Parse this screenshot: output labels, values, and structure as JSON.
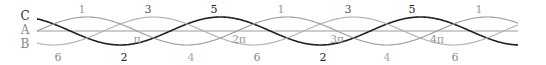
{
  "diagram": {
    "geometry": {
      "x0": 37,
      "x1": 518,
      "axis_y": 31,
      "amplitude": 14,
      "px_per_pi": 100
    },
    "axis": {
      "color": "#9a9a9a"
    },
    "curves": [
      {
        "name": "C",
        "label": "C",
        "phase": 2.0944,
        "color": "#222222",
        "width": 1.6,
        "label_y": 20,
        "label_color": "#333333"
      },
      {
        "name": "A",
        "label": "A",
        "phase": 0,
        "color": "#9a9a9a",
        "width": 1.1,
        "label_y": 34,
        "label_color": "#888888"
      },
      {
        "name": "B",
        "label": "B",
        "phase": -2.0944,
        "color": "#b0b0b0",
        "width": 1.1,
        "label_y": 48,
        "label_color": "#888888"
      }
    ],
    "top_labels": [
      {
        "text": "1",
        "x": 82,
        "color": "#999999"
      },
      {
        "text": "3",
        "x": 148,
        "color": "#555555"
      },
      {
        "text": "5",
        "x": 214,
        "color": "#222222"
      },
      {
        "text": "1",
        "x": 281,
        "color": "#999999"
      },
      {
        "text": "3",
        "x": 348,
        "color": "#555555"
      },
      {
        "text": "5",
        "x": 412,
        "color": "#222222"
      },
      {
        "text": "1",
        "x": 479,
        "color": "#999999"
      }
    ],
    "bottom_labels": [
      {
        "text": "6",
        "x": 58,
        "color": "#888888"
      },
      {
        "text": "2",
        "x": 124,
        "color": "#222222"
      },
      {
        "text": "4",
        "x": 191,
        "color": "#aaaaaa"
      },
      {
        "text": "6",
        "x": 257,
        "color": "#888888"
      },
      {
        "text": "2",
        "x": 323,
        "color": "#222222"
      },
      {
        "text": "4",
        "x": 387,
        "color": "#aaaaaa"
      },
      {
        "text": "6",
        "x": 455,
        "color": "#888888"
      }
    ],
    "pi_labels": [
      {
        "text": "π",
        "x": 137
      },
      {
        "text": "2π",
        "x": 239
      },
      {
        "text": "3π",
        "x": 337
      },
      {
        "text": "4π",
        "x": 437
      }
    ]
  }
}
